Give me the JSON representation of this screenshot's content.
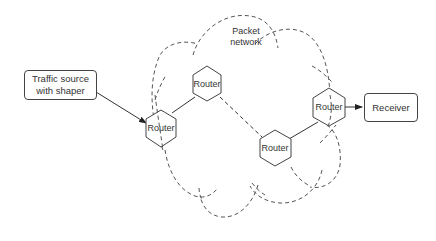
{
  "diagram": {
    "title": "Packet network",
    "network_label_line1": "Packet",
    "network_label_line2": "network",
    "source": {
      "line1": "Traffic source",
      "line2": "with shaper"
    },
    "receiver": {
      "label": "Receiver"
    },
    "routers": [
      {
        "id": "router-1",
        "label": "Router"
      },
      {
        "id": "router-2",
        "label": "Router"
      },
      {
        "id": "router-3",
        "label": "Router"
      },
      {
        "id": "router-4",
        "label": "Router"
      }
    ],
    "links": [
      {
        "from": "source",
        "to": "router-1",
        "style": "solid-arrow"
      },
      {
        "from": "router-1",
        "to": "router-2",
        "style": "solid"
      },
      {
        "from": "router-2",
        "to": "router-3",
        "style": "dashed"
      },
      {
        "from": "router-3",
        "to": "router-4",
        "style": "solid"
      },
      {
        "from": "router-4",
        "to": "receiver",
        "style": "solid-arrow"
      }
    ],
    "colors": {
      "stroke": "#444444",
      "cloud": "#555555",
      "text": "#333333",
      "background": "#ffffff"
    }
  }
}
